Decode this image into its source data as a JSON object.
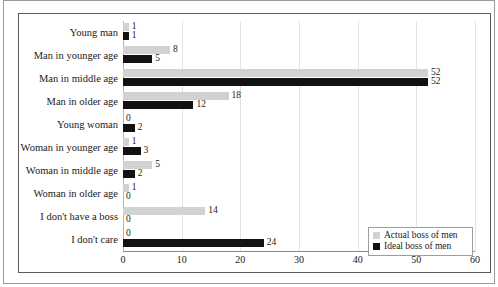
{
  "chart_data": {
    "type": "bar",
    "orientation": "horizontal",
    "title": "",
    "xlabel": "",
    "ylabel": "",
    "xlim": [
      0,
      60
    ],
    "xticks": [
      0,
      10,
      20,
      30,
      40,
      50,
      60
    ],
    "grid": true,
    "legend_position": "bottom-right",
    "categories": [
      "Young man",
      "Man in younger age",
      "Man in middle age",
      "Man in older age",
      "Young woman",
      "Woman in younger age",
      "Woman in middle age",
      "Woman in older age",
      "I don't have a boss",
      "I don't care"
    ],
    "series": [
      {
        "name": "Actual boss of men",
        "color": "#d2d2d2",
        "values": [
          1,
          8,
          52,
          18,
          0,
          1,
          5,
          1,
          14,
          0
        ]
      },
      {
        "name": "Ideal boss of men",
        "color": "#121212",
        "values": [
          1,
          5,
          52,
          12,
          2,
          3,
          2,
          0,
          0,
          24
        ]
      }
    ]
  },
  "legend": {
    "entries": [
      {
        "label": "Actual boss of men",
        "swatch": "actual"
      },
      {
        "label": "Ideal boss of men",
        "swatch": "ideal"
      }
    ]
  },
  "colors": {
    "actual": "#d2d2d2",
    "ideal": "#121212",
    "grid": "#e2e2e2",
    "frame": "#5a5a5a",
    "page_border": "#9a9a9a"
  }
}
